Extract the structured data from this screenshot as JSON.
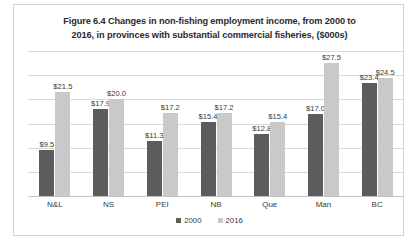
{
  "chart_data": {
    "type": "bar",
    "title": "Figure 6.4 Changes in non-fishing employment income, from 2000 to 2016, in provinces with substantial commercial fisheries, ($000s)",
    "title_line1": "Figure 6.4 Changes in non-fishing employment income, from 2000 to",
    "title_line2": "2016, in provinces with substantial commercial fisheries, ($000s)",
    "xlabel": "",
    "ylabel": "",
    "ylim": [
      0,
      30
    ],
    "grid": true,
    "gridline_values": [
      30,
      25,
      20,
      15,
      10,
      5,
      0
    ],
    "y_tick_labels_visible": false,
    "legend_position": "bottom",
    "categories": [
      "N&L",
      "NS",
      "PEI",
      "NB",
      "Que",
      "Man",
      "BC"
    ],
    "series": [
      {
        "name": "2000",
        "color": "#5c5c5c",
        "values": [
          9.5,
          17.9,
          11.3,
          15.4,
          12.8,
          17.0,
          23.4
        ],
        "labels": [
          "$9.5",
          "$17.9",
          "$11.3",
          "$15.4",
          "$12.8",
          "$17.0",
          "$23.4"
        ]
      },
      {
        "name": "2016",
        "color": "#c9c9c9",
        "values": [
          21.5,
          20.0,
          17.2,
          17.2,
          15.4,
          27.5,
          24.5
        ],
        "labels": [
          "$21.5",
          "$20.0",
          "$17.2",
          "$17.2",
          "$15.4",
          "$27.5",
          "$24.5"
        ]
      }
    ]
  },
  "legend": {
    "entries": [
      {
        "label": "2000",
        "color": "#5c5c5c"
      },
      {
        "label": "2016",
        "color": "#c9c9c9"
      }
    ]
  }
}
